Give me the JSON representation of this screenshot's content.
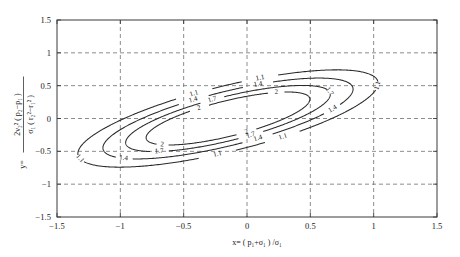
{
  "figure": {
    "background_color": "#ffffff",
    "line_color": "#2a2a2a",
    "grid_color": "#6f6f6f"
  },
  "axes": {
    "x_title_prefix": "x=",
    "x_title": "x=  ( p₁+σ₁ ) /σ₁",
    "y_title": "y=  2ν₂²( p₂−p₁ ) / σ₁( r₂²−r₁² )",
    "y_title_lead": "y=",
    "y_title_numerator": "2ν₂² ( p₂−p₁ )",
    "y_title_denominator": "σ₁ ( r₂²−r₁² )",
    "x_ticks": [
      "-1.5",
      "-1",
      "-0.5",
      "0",
      "0.5",
      "1",
      "1.5"
    ],
    "y_ticks": [
      "1.5",
      "1",
      "0.5",
      "0",
      "-0.5",
      "-1",
      "-1.5"
    ],
    "x_tick_values": [
      -1.5,
      -1,
      -0.5,
      0,
      0.5,
      1,
      1.5
    ],
    "y_tick_values": [
      1.5,
      1,
      0.5,
      0,
      -0.5,
      -1,
      -1.5
    ],
    "xlim": [
      -1.5,
      1.5
    ],
    "ylim": [
      -1.5,
      1.5
    ],
    "grid": true
  },
  "chart_data": {
    "type": "line",
    "subtype": "contour-ellipses",
    "title": "",
    "xlabel": "x=  ( p₁+σ₁ ) /σ₁",
    "ylabel": "y=  2ν₂²( p₂−p₁ ) / σ₁( r₂²−r₁² )",
    "xlim": [
      -1.5,
      1.5
    ],
    "ylim": [
      -1.5,
      1.5
    ],
    "grid": true,
    "legend": "none",
    "contour_levels": [
      1.1,
      1.4,
      1.7,
      2
    ],
    "contour_level_labels": [
      "1.1",
      "1.4",
      "1.7",
      "2"
    ],
    "center": [
      -0.15,
      0.0
    ],
    "rotation_deg": 28,
    "series": [
      {
        "name": "1.1",
        "level": 1.1,
        "type": "ellipse",
        "center": [
          -0.15,
          0.0
        ],
        "semi_major": 1.32,
        "semi_minor": 0.46,
        "rotation_deg": 28,
        "label_positions": [
          [
            -0.52,
            0.52
          ],
          [
            0.27,
            1.02
          ],
          [
            1.03,
            0.5
          ],
          [
            0.62,
            -0.5
          ],
          [
            -0.3,
            -1.0
          ],
          [
            -1.07,
            -0.48
          ]
        ]
      },
      {
        "name": "1.4",
        "level": 1.4,
        "type": "ellipse",
        "center": [
          -0.15,
          0.0
        ],
        "semi_major": 1.1,
        "semi_minor": 0.38,
        "rotation_deg": 28,
        "label_positions": [
          [
            -0.5,
            0.36
          ],
          [
            0.23,
            0.83
          ],
          [
            0.83,
            0.17
          ],
          [
            0.32,
            -0.6
          ],
          [
            -0.83,
            -0.5
          ]
        ]
      },
      {
        "name": "1.7",
        "level": 1.7,
        "type": "ellipse",
        "center": [
          -0.15,
          0.0
        ],
        "semi_major": 0.9,
        "semi_minor": 0.31,
        "rotation_deg": 28,
        "label_positions": [
          [
            -0.36,
            0.48
          ],
          [
            0.63,
            0.4
          ],
          [
            0.2,
            -0.5
          ],
          [
            -0.66,
            -0.47
          ]
        ]
      },
      {
        "name": "2",
        "level": 2,
        "type": "ellipse",
        "center": [
          -0.15,
          0.0
        ],
        "semi_major": 0.72,
        "semi_minor": 0.25,
        "rotation_deg": 28,
        "label_positions": [
          [
            -0.47,
            0.22
          ],
          [
            0.36,
            0.53
          ],
          [
            0.12,
            -0.38
          ],
          [
            -0.54,
            -0.3
          ]
        ]
      }
    ]
  }
}
